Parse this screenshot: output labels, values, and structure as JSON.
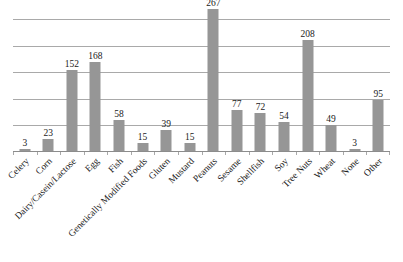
{
  "chart_data": {
    "type": "bar",
    "title": "",
    "xlabel": "",
    "ylabel": "",
    "ylim": [
      0,
      250
    ],
    "grid": true,
    "gridlines": [
      0,
      50,
      100,
      150,
      200,
      250
    ],
    "y_tick_labels_visible": false,
    "legend": "none",
    "bar_color": "#969696",
    "gridline_color": "#a9a9a9",
    "value_labels_shown": true,
    "categories": [
      "Celery",
      "Corn",
      "Dairy/Casein/Lactose",
      "Egg",
      "Fish",
      "Genetically Modified Foods",
      "Gluten",
      "Mustard",
      "Peanuts",
      "Sesame",
      "Shellfish",
      "Soy",
      "Tree Nuts",
      "Wheat",
      "None",
      "Other"
    ],
    "values": [
      3,
      23,
      152,
      168,
      58,
      15,
      39,
      15,
      267,
      77,
      72,
      54,
      208,
      49,
      3,
      95
    ]
  }
}
